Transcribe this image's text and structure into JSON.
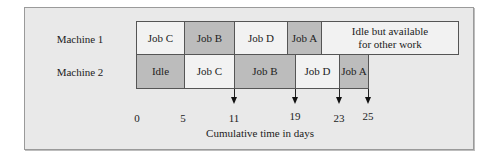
{
  "diagram": {
    "type": "gantt",
    "colors": {
      "light_cell": "#f2f2f2",
      "dark_cell": "#bcbcbc",
      "frame_bg": "#e9e9e9",
      "border": "#555555"
    },
    "machines": [
      {
        "label": "Machine 1",
        "blocks": [
          {
            "label": "Job C",
            "start": 0,
            "end": 5,
            "shade": "light"
          },
          {
            "label": "Job B",
            "start": 5,
            "end": 10,
            "shade": "dark"
          },
          {
            "label": "Job D",
            "start": 10,
            "end": 16,
            "shade": "light"
          },
          {
            "label": "Job A",
            "start": 16,
            "end": 20,
            "shade": "dark"
          },
          {
            "label": "Idle but available for other work",
            "start": 20,
            "end": 35,
            "shade": "light"
          }
        ]
      },
      {
        "label": "Machine 2",
        "blocks": [
          {
            "label": "Idle",
            "start": 0,
            "end": 5,
            "shade": "dark"
          },
          {
            "label": "Job C",
            "start": 5,
            "end": 11,
            "shade": "light"
          },
          {
            "label": "Job B",
            "start": 11,
            "end": 19,
            "shade": "dark"
          },
          {
            "label": "Job D",
            "start": 19,
            "end": 23,
            "shade": "light"
          },
          {
            "label": "Job A",
            "start": 23,
            "end": 25,
            "shade": "dark"
          }
        ]
      }
    ],
    "axis": {
      "title": "Cumulative time in days",
      "ticks": [
        "0",
        "5",
        "11",
        "19",
        "23",
        "25"
      ],
      "arrow_markers": [
        "11",
        "19",
        "23",
        "25"
      ]
    }
  }
}
